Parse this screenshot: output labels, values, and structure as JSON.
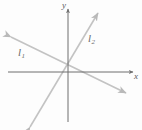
{
  "figure": {
    "kind": "coordinate-plane-two-lines",
    "background_color": "#fdfdfd",
    "axis_color": "#6e6e6e",
    "line_color": "#c3c3c3",
    "label_color": "#5f5f5f",
    "axes": {
      "x_label": "x",
      "y_label": "y",
      "origin": {
        "x": 68,
        "y": 72
      },
      "x_axis": {
        "x1": 8,
        "y1": 72,
        "x2": 133,
        "y2": 72,
        "arrow": "right"
      },
      "y_axis": {
        "x1": 68,
        "y1": 122,
        "x2": 68,
        "y2": 9,
        "arrow": "up"
      }
    },
    "lines": [
      {
        "name": "l1",
        "label": "l",
        "subscript": "1",
        "slope_sign": "negative",
        "x1": 11,
        "y1": 37,
        "x2": 126,
        "y2": 93,
        "arrows": "both"
      },
      {
        "name": "l2",
        "label": "l",
        "subscript": "2",
        "slope_sign": "positive",
        "x1": 30,
        "y1": 127,
        "x2": 98,
        "y2": 13,
        "arrows": "both"
      }
    ]
  }
}
